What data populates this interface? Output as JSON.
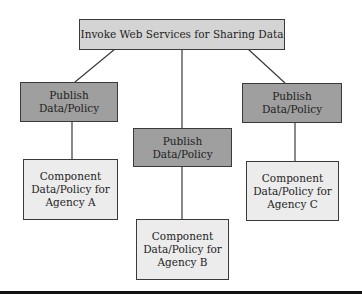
{
  "diagram": {
    "type": "hierarchy",
    "root": {
      "label": "Invoke Web Services for Sharing Data"
    },
    "branches": [
      {
        "publish": {
          "line1": "Publish",
          "line2": "Data/Policy"
        },
        "component": {
          "line1": "Component",
          "line2": "Data/Policy for",
          "line3": "Agency A"
        }
      },
      {
        "publish": {
          "line1": "Publish",
          "line2": "Data/Policy"
        },
        "component": {
          "line1": "Component",
          "line2": "Data/Policy for",
          "line3": "Agency B"
        }
      },
      {
        "publish": {
          "line1": "Publish",
          "line2": "Data/Policy"
        },
        "component": {
          "line1": "Component",
          "line2": "Data/Policy for",
          "line3": "Agency C"
        }
      }
    ],
    "colors": {
      "root_fill": "#d4d4d4",
      "publish_fill": "#9f9f9f",
      "component_fill": "#ececec",
      "border": "#3a3a3a"
    }
  }
}
